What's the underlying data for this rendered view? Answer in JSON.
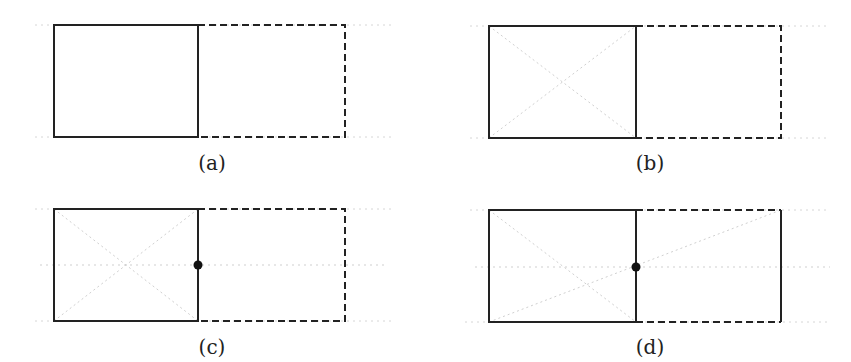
{
  "panels": [
    {
      "id": "a",
      "caption": "(a)"
    },
    {
      "id": "b",
      "caption": "(b)"
    },
    {
      "id": "c",
      "caption": "(c)"
    },
    {
      "id": "d",
      "caption": "(d)"
    }
  ],
  "colors": {
    "stroke": "#222222",
    "guide": "#cfcfcf"
  }
}
